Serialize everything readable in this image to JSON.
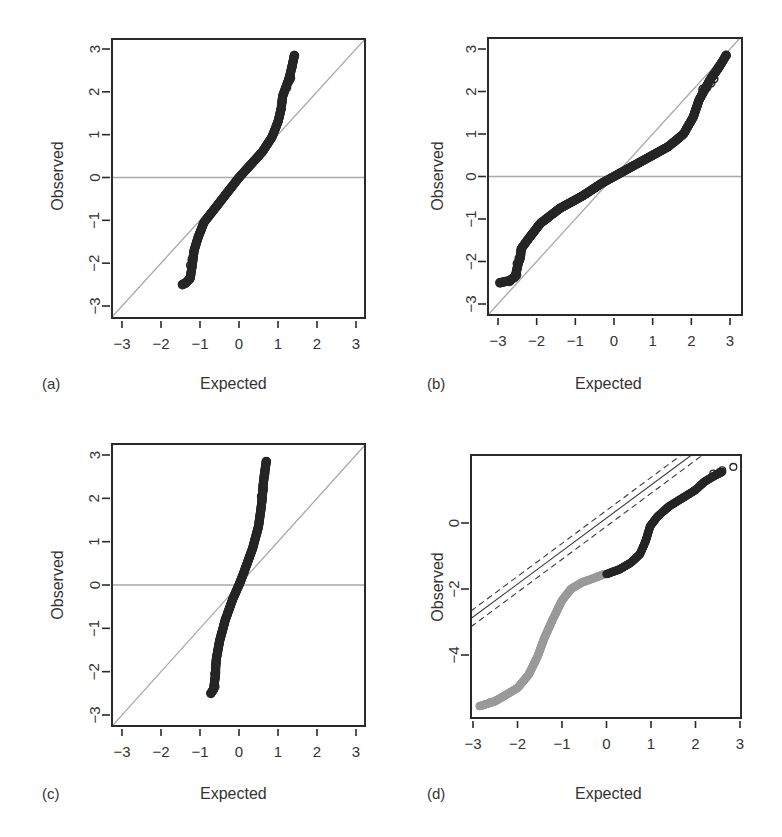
{
  "figure": {
    "panels": [
      {
        "id": "a",
        "label": "(a)",
        "xlabel": "Expected",
        "ylabel": "Observed"
      },
      {
        "id": "b",
        "label": "(b)",
        "xlabel": "Expected",
        "ylabel": "Observed"
      },
      {
        "id": "c",
        "label": "(c)",
        "xlabel": "Expected",
        "ylabel": "Observed"
      },
      {
        "id": "d",
        "label": "(d)",
        "xlabel": "Expected",
        "ylabel": "Observed"
      }
    ]
  },
  "colors": {
    "frame": "#2a2a2a",
    "reference_line": "#a8a8a8",
    "points_dark": "#262626",
    "points_grey": "#9a9a9a",
    "confidence_line": "#3a3a3a"
  },
  "chart_data": [
    {
      "panel": "a",
      "type": "scatter",
      "title": "",
      "xlabel": "Expected",
      "ylabel": "Observed",
      "xlim": [
        -3.25,
        3.25
      ],
      "ylim": [
        -3.25,
        3.25
      ],
      "xticks": [
        -3,
        -2,
        -1,
        0,
        1,
        2,
        3
      ],
      "yticks": [
        -3,
        -2,
        -1,
        0,
        1,
        2,
        3
      ],
      "grid": false,
      "reference_lines": [
        {
          "kind": "identity",
          "slope": 1,
          "intercept": 0
        },
        {
          "kind": "horizontal",
          "y": 0
        }
      ],
      "curve": [
        [
          -1.45,
          -2.5
        ],
        [
          -1.35,
          -2.45
        ],
        [
          -1.25,
          -2.35
        ],
        [
          -1.2,
          -2.05
        ],
        [
          -1.18,
          -1.9
        ],
        [
          -1.15,
          -1.7
        ],
        [
          -1.05,
          -1.4
        ],
        [
          -0.9,
          -1.05
        ],
        [
          -0.6,
          -0.7
        ],
        [
          -0.3,
          -0.35
        ],
        [
          0.0,
          0.0
        ],
        [
          0.3,
          0.3
        ],
        [
          0.6,
          0.6
        ],
        [
          0.85,
          0.95
        ],
        [
          1.0,
          1.3
        ],
        [
          1.08,
          1.6
        ],
        [
          1.12,
          1.9
        ],
        [
          1.2,
          2.1
        ],
        [
          1.28,
          2.3
        ],
        [
          1.35,
          2.55
        ],
        [
          1.42,
          2.85
        ]
      ],
      "tail_points": [
        [
          -1.45,
          -2.5
        ],
        [
          -1.38,
          -2.47
        ],
        [
          -1.28,
          -2.38
        ],
        [
          -1.24,
          -2.05
        ],
        [
          -1.2,
          -1.92
        ],
        [
          1.22,
          2.1
        ],
        [
          1.28,
          2.25
        ],
        [
          1.32,
          2.32
        ],
        [
          1.35,
          2.57
        ],
        [
          1.42,
          2.85
        ]
      ]
    },
    {
      "panel": "b",
      "type": "scatter",
      "title": "",
      "xlabel": "Expected",
      "ylabel": "Observed",
      "xlim": [
        -3.25,
        3.25
      ],
      "ylim": [
        -3.25,
        3.25
      ],
      "xticks": [
        -3,
        -2,
        -1,
        0,
        1,
        2,
        3
      ],
      "yticks": [
        -3,
        -2,
        -1,
        0,
        1,
        2,
        3
      ],
      "grid": false,
      "reference_lines": [
        {
          "kind": "identity",
          "slope": 1,
          "intercept": 0
        },
        {
          "kind": "horizontal",
          "y": 0
        }
      ],
      "curve": [
        [
          -2.95,
          -2.5
        ],
        [
          -2.7,
          -2.45
        ],
        [
          -2.55,
          -2.35
        ],
        [
          -2.48,
          -2.05
        ],
        [
          -2.42,
          -1.9
        ],
        [
          -2.4,
          -1.7
        ],
        [
          -2.2,
          -1.45
        ],
        [
          -1.9,
          -1.1
        ],
        [
          -1.4,
          -0.75
        ],
        [
          -0.8,
          -0.45
        ],
        [
          -0.3,
          -0.15
        ],
        [
          0.0,
          0.0
        ],
        [
          0.4,
          0.2
        ],
        [
          0.9,
          0.45
        ],
        [
          1.4,
          0.7
        ],
        [
          1.8,
          1.0
        ],
        [
          2.05,
          1.4
        ],
        [
          2.2,
          1.8
        ],
        [
          2.35,
          2.05
        ],
        [
          2.5,
          2.3
        ],
        [
          2.7,
          2.55
        ],
        [
          2.9,
          2.85
        ]
      ],
      "tail_points": [
        [
          -2.95,
          -2.5
        ],
        [
          -2.7,
          -2.47
        ],
        [
          -2.58,
          -2.38
        ],
        [
          -2.52,
          -2.32
        ],
        [
          -2.5,
          -2.05
        ],
        [
          -2.45,
          -1.92
        ],
        [
          2.3,
          2.05
        ],
        [
          2.4,
          2.1
        ],
        [
          2.5,
          2.2
        ],
        [
          2.58,
          2.3
        ],
        [
          2.7,
          2.57
        ],
        [
          2.9,
          2.85
        ]
      ]
    },
    {
      "panel": "c",
      "type": "scatter",
      "title": "",
      "xlabel": "Expected",
      "ylabel": "Observed",
      "xlim": [
        -3.25,
        3.25
      ],
      "ylim": [
        -3.25,
        3.25
      ],
      "xticks": [
        -3,
        -2,
        -1,
        0,
        1,
        2,
        3
      ],
      "yticks": [
        -3,
        -2,
        -1,
        0,
        1,
        2,
        3
      ],
      "grid": false,
      "reference_lines": [
        {
          "kind": "identity",
          "slope": 1,
          "intercept": 0
        },
        {
          "kind": "horizontal",
          "y": 0
        }
      ],
      "curve": [
        [
          -0.72,
          -2.5
        ],
        [
          -0.65,
          -2.4
        ],
        [
          -0.6,
          -2.05
        ],
        [
          -0.6,
          -1.9
        ],
        [
          -0.58,
          -1.7
        ],
        [
          -0.5,
          -1.3
        ],
        [
          -0.35,
          -0.8
        ],
        [
          -0.15,
          -0.3
        ],
        [
          0.0,
          0.0
        ],
        [
          0.15,
          0.35
        ],
        [
          0.35,
          0.85
        ],
        [
          0.5,
          1.35
        ],
        [
          0.57,
          1.8
        ],
        [
          0.6,
          2.05
        ],
        [
          0.62,
          2.3
        ],
        [
          0.65,
          2.55
        ],
        [
          0.7,
          2.85
        ]
      ],
      "tail_points": [
        [
          -0.72,
          -2.5
        ],
        [
          -0.66,
          -2.42
        ],
        [
          -0.62,
          -2.35
        ],
        [
          -0.62,
          -2.05
        ],
        [
          -0.6,
          -1.9
        ],
        [
          0.58,
          2.05
        ],
        [
          0.62,
          2.2
        ],
        [
          0.62,
          2.3
        ],
        [
          0.66,
          2.57
        ],
        [
          0.7,
          2.85
        ]
      ]
    },
    {
      "panel": "d",
      "type": "scatter",
      "title": "",
      "xlabel": "Expected",
      "ylabel": "Observed",
      "xlim": [
        -3.05,
        2.95
      ],
      "ylim": [
        -5.86,
        2.04
      ],
      "xticks": [
        -3,
        -2,
        -1,
        0,
        1,
        2,
        3
      ],
      "yticks": [
        -4,
        -2,
        0
      ],
      "grid": false,
      "reference_lines": [
        {
          "kind": "solid",
          "slope": 1.0,
          "intercept": 0.15
        },
        {
          "kind": "dashed",
          "slope": 1.0,
          "intercept": 0.38
        },
        {
          "kind": "dashed",
          "slope": 1.0,
          "intercept": -0.1
        }
      ],
      "grey_series_curve": [
        [
          -2.85,
          -5.55
        ],
        [
          -2.5,
          -5.4
        ],
        [
          -2.25,
          -5.2
        ],
        [
          -2.0,
          -5.0
        ],
        [
          -1.75,
          -4.6
        ],
        [
          -1.55,
          -4.05
        ],
        [
          -1.4,
          -3.5
        ],
        [
          -1.2,
          -2.9
        ],
        [
          -1.0,
          -2.35
        ],
        [
          -0.8,
          -2.0
        ],
        [
          -0.55,
          -1.8
        ],
        [
          -0.3,
          -1.68
        ],
        [
          -0.05,
          -1.55
        ]
      ],
      "dark_series_curve": [
        [
          0.0,
          -1.55
        ],
        [
          0.3,
          -1.4
        ],
        [
          0.55,
          -1.2
        ],
        [
          0.75,
          -0.95
        ],
        [
          0.88,
          -0.55
        ],
        [
          0.98,
          -0.1
        ],
        [
          1.15,
          0.2
        ],
        [
          1.4,
          0.5
        ],
        [
          1.7,
          0.75
        ],
        [
          2.0,
          1.0
        ],
        [
          2.2,
          1.25
        ],
        [
          2.45,
          1.45
        ],
        [
          2.6,
          1.55
        ]
      ],
      "tail_points": [
        [
          -2.85,
          -5.55
        ],
        [
          -2.6,
          -5.42
        ],
        [
          -2.45,
          -5.35
        ],
        [
          -2.3,
          -5.25
        ],
        [
          2.4,
          1.5
        ],
        [
          2.55,
          1.55
        ],
        [
          2.6,
          1.6
        ],
        [
          2.85,
          1.7
        ]
      ]
    }
  ]
}
